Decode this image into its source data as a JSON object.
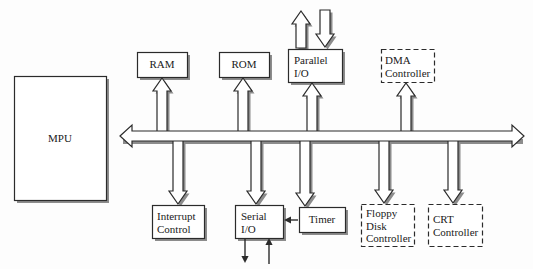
{
  "diagram": {
    "background_color": "#fdfdfd",
    "line_color": "#2b2b2b",
    "shadow_color": "#8c8c8c",
    "fill_color": "#ffffff",
    "bus": {
      "name": "system-bus",
      "left_arrow": "arrow-left",
      "right_arrow": "arrow-right",
      "x": 118,
      "y": 131,
      "width": 408,
      "height": 10
    },
    "blocks": [
      {
        "id": "mpu",
        "label": "MPU",
        "border": "solid",
        "align": "center",
        "x": 14,
        "y": 76,
        "width": 92,
        "height": 124,
        "label_x": 14,
        "label_y": 132,
        "label_width": 92
      },
      {
        "id": "ram",
        "label": "RAM",
        "border": "solid",
        "align": "center",
        "x": 137,
        "y": 52,
        "width": 50,
        "height": 25,
        "label_x": 137,
        "label_y": 58,
        "label_width": 50
      },
      {
        "id": "rom",
        "label": "ROM",
        "border": "solid",
        "align": "center",
        "x": 219,
        "y": 52,
        "width": 50,
        "height": 25,
        "label_x": 219,
        "label_y": 58,
        "label_width": 50
      },
      {
        "id": "parallel-io",
        "label": "Parallel\nI/O",
        "border": "solid",
        "align": "left",
        "x": 288,
        "y": 49,
        "width": 54,
        "height": 33,
        "label_x": 294,
        "label_y": 54,
        "label_width": 48
      },
      {
        "id": "dma-controller",
        "label": "DMA\nController",
        "border": "dashed",
        "align": "left",
        "x": 381,
        "y": 49,
        "width": 53,
        "height": 33,
        "label_x": 385,
        "label_y": 54,
        "label_width": 50
      },
      {
        "id": "interrupt-control",
        "label": "Interrupt\nControl",
        "border": "solid",
        "align": "left",
        "x": 152,
        "y": 205,
        "width": 52,
        "height": 33,
        "label_x": 157,
        "label_y": 210,
        "label_width": 48
      },
      {
        "id": "serial-io",
        "label": "Serial\nI/O",
        "border": "solid",
        "align": "left",
        "x": 235,
        "y": 205,
        "width": 48,
        "height": 33,
        "label_x": 241,
        "label_y": 210,
        "label_width": 44
      },
      {
        "id": "timer",
        "label": "Timer",
        "border": "solid",
        "align": "center",
        "x": 299,
        "y": 207,
        "width": 46,
        "height": 25,
        "label_x": 299,
        "label_y": 213,
        "label_width": 46
      },
      {
        "id": "floppy-disk-controller",
        "label": "Floppy\nDisk\nController",
        "border": "dashed",
        "align": "left",
        "x": 361,
        "y": 204,
        "width": 53,
        "height": 42,
        "label_x": 366,
        "label_y": 207,
        "label_width": 50
      },
      {
        "id": "crt-controller",
        "label": "CRT\nController",
        "border": "dashed",
        "align": "left",
        "x": 428,
        "y": 204,
        "width": 54,
        "height": 42,
        "label_x": 433,
        "label_y": 213,
        "label_width": 50
      }
    ],
    "connectors": [
      {
        "id": "bus-to-ram",
        "kind": "block-arrow-up",
        "x": 162,
        "top": 78,
        "bottom": 133
      },
      {
        "id": "bus-to-rom",
        "kind": "block-arrow-up",
        "x": 243,
        "top": 78,
        "bottom": 133
      },
      {
        "id": "bus-to-parallel-io",
        "kind": "block-arrow-up",
        "x": 312,
        "top": 83,
        "bottom": 133
      },
      {
        "id": "bus-to-dma-controller",
        "kind": "block-arrow-up",
        "x": 406,
        "top": 83,
        "bottom": 133
      },
      {
        "id": "bus-to-interrupt-control",
        "kind": "block-arrow-down",
        "x": 178,
        "top": 140,
        "bottom": 204
      },
      {
        "id": "bus-to-serial-io",
        "kind": "block-arrow-down",
        "x": 256,
        "top": 140,
        "bottom": 204
      },
      {
        "id": "bus-to-timer",
        "kind": "block-arrow-down",
        "x": 305,
        "top": 140,
        "bottom": 206
      },
      {
        "id": "bus-to-floppy-disk-controller",
        "kind": "block-arrow-down",
        "x": 384,
        "top": 140,
        "bottom": 203
      },
      {
        "id": "bus-to-crt-controller",
        "kind": "block-arrow-down",
        "x": 453,
        "top": 140,
        "bottom": 203
      },
      {
        "id": "parallel-io-output-up",
        "kind": "block-arrow-up-free",
        "x": 301,
        "top": 11,
        "bottom": 48
      },
      {
        "id": "parallel-io-input-down",
        "kind": "block-arrow-down-free",
        "x": 325,
        "top": 10,
        "bottom": 47
      },
      {
        "id": "timer-to-serial-io",
        "kind": "thin-arrow-left",
        "x1": 298,
        "x2": 284,
        "y": 220
      },
      {
        "id": "serial-io-output-down",
        "kind": "thin-arrow-down",
        "x": 245,
        "top": 239,
        "bottom": 263
      },
      {
        "id": "serial-io-input-up",
        "kind": "thin-arrow-up",
        "x": 269,
        "top": 238,
        "bottom": 264
      }
    ]
  }
}
